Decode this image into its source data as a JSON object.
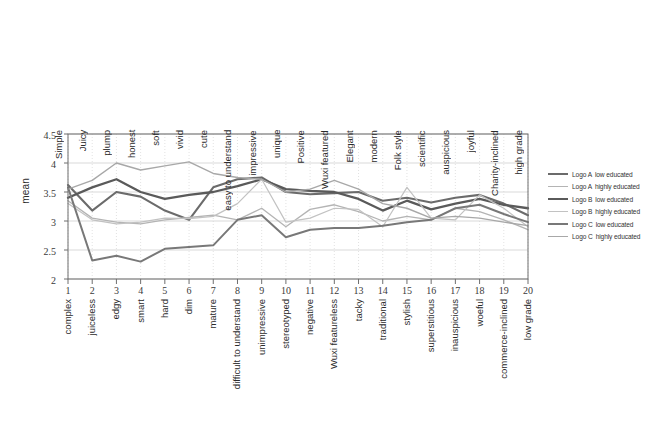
{
  "chart_data": {
    "type": "line",
    "title": "",
    "xlabel": "",
    "ylabel": "mean",
    "ylim": [
      2,
      4.5
    ],
    "yticks": [
      "2",
      "2.5",
      "3",
      "3.5",
      "4",
      "4.5"
    ],
    "grid": true,
    "legend_position": "right",
    "x": [
      1,
      2,
      3,
      4,
      5,
      6,
      7,
      8,
      9,
      10,
      11,
      12,
      13,
      14,
      15,
      16,
      17,
      18,
      19,
      20
    ],
    "xticklabels_top": [
      "Simple",
      "Juicy",
      "plump",
      "honest",
      "soft",
      "vivid",
      "cute",
      "easy to understand",
      "impressive",
      "unique",
      "Positive",
      "Wuxi featured",
      "Elegant",
      "modern",
      "Folk style",
      "scientific",
      "auspicious",
      "joyful",
      "Charity-inclined",
      "high grade"
    ],
    "xticklabels_bottom": [
      "complex",
      "juiceless",
      "edgy",
      "smart",
      "hard",
      "dim",
      "mature",
      "difficult to understand",
      "unimpressive",
      "stereotyped",
      "negative",
      "Wuxi featureless",
      "tacky",
      "traditional",
      "stylish",
      "superstitious",
      "inauspicious",
      "woeful",
      "commerce-inclined",
      "low grade"
    ],
    "series": [
      {
        "name": "Logo A  low educated",
        "legend_label_series": "Logo A",
        "legend_label_group": "low educated",
        "color": "#6b6b6b",
        "width": 2.1,
        "values": [
          3.62,
          3.18,
          3.5,
          3.42,
          3.18,
          3.02,
          3.58,
          3.72,
          3.75,
          3.5,
          3.46,
          3.48,
          3.5,
          3.35,
          3.4,
          3.32,
          3.4,
          3.45,
          3.3,
          3.1
        ]
      },
      {
        "name": "Logo A  highly educated",
        "legend_label_series": "Logo A",
        "legend_label_group": "highly educated",
        "color": "#b4b4b4",
        "width": 1.3,
        "values": [
          3.35,
          3.05,
          2.98,
          2.95,
          3.02,
          3.06,
          3.1,
          3.02,
          3.22,
          2.9,
          3.2,
          3.28,
          3.16,
          3.0,
          3.08,
          3.02,
          3.22,
          3.16,
          3.02,
          2.85
        ]
      },
      {
        "name": "Logo B  low educated",
        "legend_label_series": "Logo B",
        "legend_label_group": "low educated",
        "color": "#5a5a5a",
        "width": 2.3,
        "values": [
          3.4,
          3.58,
          3.72,
          3.5,
          3.38,
          3.45,
          3.5,
          3.6,
          3.72,
          3.55,
          3.52,
          3.5,
          3.38,
          3.18,
          3.35,
          3.2,
          3.3,
          3.38,
          3.28,
          3.22
        ]
      },
      {
        "name": "Logo B  highly educated",
        "legend_label_series": "Logo B",
        "legend_label_group": "highly educated",
        "color": "#c2c2c2",
        "width": 1.2,
        "values": [
          3.3,
          3.02,
          2.95,
          2.98,
          3.05,
          3.04,
          3.08,
          3.3,
          3.72,
          2.98,
          3.05,
          3.22,
          3.2,
          2.9,
          3.58,
          3.05,
          3.02,
          3.45,
          3.22,
          2.9
        ]
      },
      {
        "name": "Logo C  low educated",
        "legend_label_series": "Logo C",
        "legend_label_group": "low educated",
        "color": "#787878",
        "width": 2.0,
        "values": [
          3.58,
          2.32,
          2.4,
          2.3,
          2.52,
          2.55,
          2.58,
          3.02,
          3.1,
          2.72,
          2.85,
          2.88,
          2.88,
          2.92,
          2.98,
          3.02,
          3.22,
          3.28,
          3.12,
          2.98
        ]
      },
      {
        "name": "Logo C  highly educated",
        "legend_label_series": "Logo C",
        "legend_label_group": "highly educated",
        "color": "#a8a8a8",
        "width": 1.4,
        "values": [
          3.55,
          3.7,
          4.0,
          3.88,
          3.95,
          4.02,
          3.82,
          3.75,
          3.72,
          3.5,
          3.55,
          3.7,
          3.55,
          3.3,
          3.22,
          3.05,
          3.08,
          3.05,
          2.98,
          2.92
        ]
      }
    ]
  },
  "plot": {
    "axis_color": "#6e6e6e",
    "grid_color": "#cfcfcf",
    "bg_color": "#ffffff"
  }
}
